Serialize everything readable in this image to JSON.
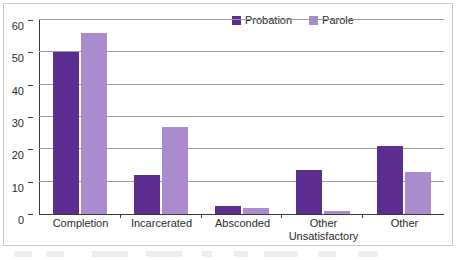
{
  "chart_data": {
    "type": "bar",
    "title": "",
    "subtitle": "",
    "xlabel": "",
    "ylabel": "",
    "categories": [
      "Completion",
      "Incarcerated",
      "Absconded",
      "Other Unsatisfactory",
      "Other"
    ],
    "category_lines": [
      [
        "Completion"
      ],
      [
        "Incarcerated"
      ],
      [
        "Absconded"
      ],
      [
        "Other",
        "Unsatisfactory"
      ],
      [
        "Other"
      ]
    ],
    "series": [
      {
        "name": "Probation",
        "color": "#5c2d91",
        "values": [
          50,
          12,
          2.5,
          13.5,
          21
        ]
      },
      {
        "name": "Parole",
        "color": "#a98bce",
        "values": [
          56,
          27,
          2,
          1,
          13
        ]
      }
    ],
    "ylim": [
      0,
      60
    ],
    "yticks": [
      0,
      10,
      20,
      30,
      40,
      50,
      60
    ],
    "ytick_labels": [
      "0",
      "10",
      "20",
      "30",
      "40",
      "50",
      "60"
    ],
    "grid": true,
    "grid_axis": "y",
    "legend_position": "top-right",
    "orientation": "vertical",
    "grouping": "grouped"
  },
  "legend": {
    "items": [
      {
        "label": "Probation",
        "color": "#5c2d91"
      },
      {
        "label": "Parole",
        "color": "#a98bce"
      }
    ]
  }
}
